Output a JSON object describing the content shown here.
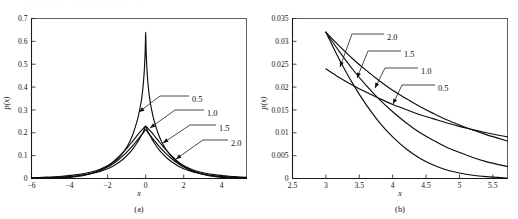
{
  "figure": {
    "top_bleed_text": "· · ·  · · ·  · · · ·  · · ·",
    "background_color": "#ffffff",
    "curve_color": "#0d0d0d",
    "frame_color": "#3a3a3a"
  },
  "chart_data": [
    {
      "type": "line",
      "panel_label": "(a)",
      "title": "",
      "xlabel": "x",
      "ylabel": "p(x)",
      "xlim": [
        -6,
        5.3
      ],
      "ylim": [
        0,
        0.7
      ],
      "grid": false,
      "legend_position": "inline-annotations",
      "xticks": [
        -6,
        -4,
        -2,
        0,
        2,
        4
      ],
      "xticklabels": [
        "−6",
        "−4",
        "−2",
        "0",
        "2",
        "4"
      ],
      "yticks": [
        0,
        0.1,
        0.2,
        0.3,
        0.4,
        0.5,
        0.6,
        0.7
      ],
      "yticklabels": [
        "0",
        "0.1",
        "0.2",
        "0.3",
        "0.4",
        "0.5",
        "0.6",
        "0.7"
      ],
      "annotations": [
        {
          "text": "0.5",
          "label_x": 192,
          "label_y": 99,
          "leader": [
            [
              189,
              96
            ],
            [
              160,
              96
            ],
            [
              139,
              112
            ]
          ],
          "arrow": [
            139,
            112
          ],
          "arrow_angle": 145
        },
        {
          "text": "1.0",
          "label_x": 207,
          "label_y": 113,
          "leader": [
            [
              204,
              110
            ],
            [
              175,
              110
            ],
            [
              150,
              128
            ]
          ],
          "arrow": [
            150,
            128
          ],
          "arrow_angle": 145
        },
        {
          "text": "1.5",
          "label_x": 219,
          "label_y": 128,
          "leader": [
            [
              216,
              125
            ],
            [
              190,
              125
            ],
            [
              163,
              143
            ]
          ],
          "arrow": [
            163,
            143
          ],
          "arrow_angle": 145
        },
        {
          "text": "2.0",
          "label_x": 231,
          "label_y": 143,
          "leader": [
            [
              228,
              140
            ],
            [
              203,
              140
            ],
            [
              176,
              159
            ]
          ],
          "arrow": [
            176,
            159
          ],
          "arrow_angle": 145
        }
      ],
      "series": [
        {
          "name": "0.5",
          "shape_param": 0.5,
          "x": [
            -6,
            -5.6,
            -5.2,
            -4.8,
            -4.4,
            -4,
            -3.6,
            -3.2,
            -2.8,
            -2.4,
            -2,
            -1.7,
            -1.4,
            -1.1,
            -0.9,
            -0.7,
            -0.55,
            -0.42,
            -0.32,
            -0.24,
            -0.17,
            -0.12,
            -0.08,
            -0.05,
            -0.025,
            -0.01,
            0,
            0.01,
            0.025,
            0.05,
            0.08,
            0.12,
            0.17,
            0.24,
            0.32,
            0.42,
            0.55,
            0.7,
            0.9,
            1.1,
            1.4,
            1.7,
            2,
            2.4,
            2.8,
            3.2,
            3.6,
            4,
            4.4,
            4.8,
            5.3
          ],
          "y": [
            0.0035,
            0.0045,
            0.0058,
            0.0075,
            0.0097,
            0.0127,
            0.0167,
            0.0221,
            0.0296,
            0.0401,
            0.0553,
            0.0709,
            0.0926,
            0.1237,
            0.1508,
            0.187,
            0.2238,
            0.2605,
            0.2976,
            0.3335,
            0.376,
            0.418,
            0.461,
            0.506,
            0.556,
            0.608,
            0.64,
            0.608,
            0.556,
            0.506,
            0.461,
            0.418,
            0.376,
            0.3335,
            0.2976,
            0.2605,
            0.2238,
            0.187,
            0.1508,
            0.1237,
            0.0926,
            0.0709,
            0.0553,
            0.0401,
            0.0296,
            0.0221,
            0.0167,
            0.0127,
            0.0097,
            0.0075,
            0.005
          ]
        },
        {
          "name": "1.0",
          "shape_param": 1.0,
          "x": [
            -6,
            -5.6,
            -5.2,
            -4.8,
            -4.4,
            -4,
            -3.6,
            -3.2,
            -2.8,
            -2.4,
            -2,
            -1.7,
            -1.4,
            -1.1,
            -0.9,
            -0.7,
            -0.5,
            -0.35,
            -0.22,
            -0.12,
            -0.05,
            0,
            0.05,
            0.12,
            0.22,
            0.35,
            0.5,
            0.7,
            0.9,
            1.1,
            1.4,
            1.7,
            2,
            2.4,
            2.8,
            3.2,
            3.6,
            4,
            4.4,
            4.8,
            5.3
          ],
          "y": [
            0.0018,
            0.0025,
            0.0034,
            0.0047,
            0.0064,
            0.0088,
            0.0121,
            0.0166,
            0.0228,
            0.0313,
            0.043,
            0.0552,
            0.0708,
            0.0909,
            0.1073,
            0.1267,
            0.1497,
            0.17,
            0.189,
            0.205,
            0.219,
            0.228,
            0.219,
            0.205,
            0.189,
            0.17,
            0.1497,
            0.1267,
            0.1073,
            0.0909,
            0.0708,
            0.0552,
            0.043,
            0.0313,
            0.0228,
            0.0166,
            0.0121,
            0.0088,
            0.0064,
            0.0047,
            0.003
          ]
        },
        {
          "name": "1.5",
          "shape_param": 1.5,
          "x": [
            -6,
            -5.6,
            -5.2,
            -4.8,
            -4.4,
            -4,
            -3.6,
            -3.2,
            -2.8,
            -2.4,
            -2,
            -1.7,
            -1.4,
            -1.1,
            -0.9,
            -0.7,
            -0.5,
            -0.35,
            -0.22,
            -0.12,
            -0.05,
            0,
            0.05,
            0.12,
            0.22,
            0.35,
            0.5,
            0.7,
            0.9,
            1.1,
            1.4,
            1.7,
            2,
            2.4,
            2.8,
            3.2,
            3.6,
            4,
            4.4,
            4.8,
            5.3
          ],
          "y": [
            0.0008,
            0.0013,
            0.002,
            0.0031,
            0.0048,
            0.0073,
            0.011,
            0.0164,
            0.0242,
            0.0352,
            0.0506,
            0.0657,
            0.0844,
            0.1066,
            0.1234,
            0.1417,
            0.1612,
            0.1769,
            0.1905,
            0.201,
            0.209,
            0.213,
            0.209,
            0.201,
            0.1905,
            0.1769,
            0.1612,
            0.1417,
            0.1234,
            0.1066,
            0.0844,
            0.0657,
            0.0506,
            0.0352,
            0.0242,
            0.0164,
            0.011,
            0.0073,
            0.0048,
            0.0031,
            0.0016
          ]
        },
        {
          "name": "2.0",
          "shape_param": 2.0,
          "x": [
            -6,
            -5.6,
            -5.2,
            -4.8,
            -4.4,
            -4,
            -3.6,
            -3.2,
            -2.8,
            -2.4,
            -2,
            -1.7,
            -1.4,
            -1.1,
            -0.9,
            -0.7,
            -0.5,
            -0.35,
            -0.22,
            -0.12,
            -0.05,
            0,
            0.05,
            0.12,
            0.22,
            0.35,
            0.5,
            0.7,
            0.9,
            1.1,
            1.4,
            1.7,
            2,
            2.4,
            2.8,
            3.2,
            3.6,
            4,
            4.4,
            4.8,
            5.3
          ],
          "y": [
            0.0002,
            0.0004,
            0.0008,
            0.0015,
            0.0028,
            0.005,
            0.0086,
            0.0144,
            0.0233,
            0.0364,
            0.055,
            0.0735,
            0.0962,
            0.1222,
            0.1415,
            0.1618,
            0.1825,
            0.198,
            0.2105,
            0.2195,
            0.226,
            0.229,
            0.226,
            0.2195,
            0.2105,
            0.198,
            0.1825,
            0.1618,
            0.1415,
            0.1222,
            0.0962,
            0.0735,
            0.055,
            0.0364,
            0.0233,
            0.0144,
            0.0086,
            0.005,
            0.0028,
            0.0015,
            0.0006
          ]
        }
      ]
    },
    {
      "type": "line",
      "panel_label": "(b)",
      "title": "",
      "xlabel": "x",
      "ylabel": "p(x)",
      "xlim": [
        2.5,
        5.72
      ],
      "ylim": [
        0,
        0.035
      ],
      "grid": false,
      "legend_position": "inline-annotations",
      "xticks": [
        2.5,
        3,
        3.5,
        4,
        4.5,
        5,
        5.5
      ],
      "xticklabels": [
        "2.5",
        "3",
        "3.5",
        "4",
        "4.5",
        "5",
        "5.5"
      ],
      "yticks": [
        0,
        0.005,
        0.01,
        0.015,
        0.02,
        0.025,
        0.03,
        0.035
      ],
      "yticklabels": [
        "0",
        "0.005",
        "0.01",
        "0.015",
        "0.02",
        "0.025",
        "0.03",
        "0.035"
      ],
      "annotations": [
        {
          "text": "2.0",
          "label_x": 387,
          "label_y": 37,
          "leader": [
            [
              384,
              34
            ],
            [
              352,
              34
            ],
            [
              340,
              67
            ]
          ],
          "arrow": [
            340,
            67
          ],
          "arrow_angle": 110
        },
        {
          "text": "1.5",
          "label_x": 404,
          "label_y": 54,
          "leader": [
            [
              401,
              51
            ],
            [
              368,
              51
            ],
            [
              357,
              78
            ]
          ],
          "arrow": [
            357,
            78
          ],
          "arrow_angle": 112
        },
        {
          "text": "1.0",
          "label_x": 421,
          "label_y": 71,
          "leader": [
            [
              418,
              68
            ],
            [
              385,
              68
            ],
            [
              375,
              88
            ]
          ],
          "arrow": [
            375,
            88
          ],
          "arrow_angle": 115
        },
        {
          "text": "0.5",
          "label_x": 438,
          "label_y": 88,
          "leader": [
            [
              435,
              85
            ],
            [
              402,
              85
            ],
            [
              393,
              104
            ]
          ],
          "arrow": [
            393,
            104
          ],
          "arrow_angle": 115
        }
      ],
      "series": [
        {
          "name": "0.5",
          "shape_param": 0.5,
          "x": [
            3.0,
            3.2,
            3.4,
            3.6,
            3.8,
            4.0,
            4.2,
            4.4,
            4.6,
            4.8,
            5.0,
            5.2,
            5.4,
            5.72
          ],
          "y": [
            0.024,
            0.0221,
            0.0204,
            0.0189,
            0.0175,
            0.0162,
            0.0151,
            0.014,
            0.0131,
            0.0122,
            0.0114,
            0.0107,
            0.01,
            0.0091
          ]
        },
        {
          "name": "1.0",
          "shape_param": 1.0,
          "x": [
            3.0,
            3.2,
            3.4,
            3.6,
            3.8,
            4.0,
            4.2,
            4.4,
            4.6,
            4.8,
            5.0,
            5.2,
            5.4,
            5.72
          ],
          "y": [
            0.032,
            0.029,
            0.0262,
            0.0237,
            0.0214,
            0.0193,
            0.0175,
            0.0158,
            0.0143,
            0.0129,
            0.0117,
            0.0106,
            0.0096,
            0.0082
          ]
        },
        {
          "name": "1.5",
          "shape_param": 1.5,
          "x": [
            3.0,
            3.2,
            3.4,
            3.6,
            3.8,
            4.0,
            4.2,
            4.4,
            4.6,
            4.8,
            5.0,
            5.2,
            5.4,
            5.72
          ],
          "y": [
            0.032,
            0.0278,
            0.0239,
            0.0204,
            0.0173,
            0.0146,
            0.0122,
            0.0101,
            0.0084,
            0.0069,
            0.0057,
            0.0046,
            0.0037,
            0.0026
          ]
        },
        {
          "name": "2.0",
          "shape_param": 2.0,
          "x": [
            3.0,
            3.2,
            3.4,
            3.6,
            3.8,
            4.0,
            4.2,
            4.4,
            4.6,
            4.8,
            5.0,
            5.2,
            5.4,
            5.72
          ],
          "y": [
            0.032,
            0.0261,
            0.0208,
            0.0162,
            0.0123,
            0.0091,
            0.0065,
            0.0045,
            0.003,
            0.0019,
            0.0012,
            0.0007,
            0.0004,
            0.0001
          ]
        }
      ]
    }
  ]
}
